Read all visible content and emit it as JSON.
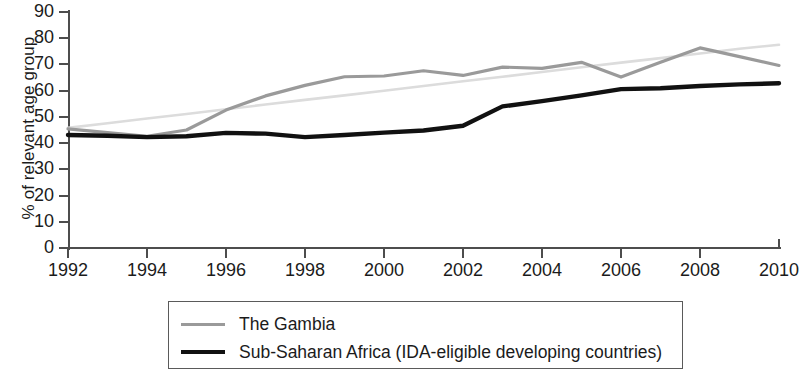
{
  "chart_data": {
    "type": "line",
    "title": "",
    "subtitle": "",
    "xlabel": "",
    "ylabel": "% of relevant age group",
    "xlim": [
      1992,
      2010
    ],
    "ylim": [
      0,
      90
    ],
    "ytick_step": 10,
    "xtick_step": 2,
    "grid": false,
    "legend_position": "below-center",
    "xticks": [
      "1992",
      "1994",
      "1996",
      "1998",
      "2000",
      "2002",
      "2004",
      "2006",
      "2008",
      "2010"
    ],
    "yticks": [
      "0",
      "10",
      "20",
      "30",
      "40",
      "50",
      "60",
      "70",
      "80",
      "90"
    ],
    "x": [
      1992,
      1993,
      1994,
      1995,
      1996,
      1997,
      1998,
      1999,
      2000,
      2001,
      2002,
      2003,
      2004,
      2005,
      2006,
      2007,
      2008,
      2009,
      2010
    ],
    "series": [
      {
        "name": "The Gambia",
        "color": "#9a9a9a",
        "width": 3.2,
        "values": [
          45.4,
          44.0,
          42.6,
          45.0,
          52.6,
          58.0,
          62.0,
          65.3,
          65.6,
          67.6,
          65.8,
          69.0,
          68.5,
          70.8,
          65.2,
          70.8,
          76.3,
          73.0,
          69.6
        ]
      },
      {
        "name": "Sub-Saharan Africa (IDA-eligible developing countries)",
        "color": "#111111",
        "width": 4.4,
        "values": [
          43.1,
          42.8,
          42.3,
          42.6,
          43.9,
          43.6,
          42.3,
          43.1,
          44.0,
          44.8,
          46.6,
          54.0,
          56.0,
          58.2,
          60.6,
          60.9,
          61.8,
          62.4,
          62.8
        ]
      },
      {
        "name": "trend",
        "color": "#dcdcdc",
        "width": 2.6,
        "is_trendline": true,
        "values": [
          45.8,
          47.6,
          49.4,
          51.1,
          52.9,
          54.7,
          56.5,
          58.2,
          60.0,
          61.8,
          63.6,
          65.3,
          67.1,
          68.9,
          70.7,
          72.4,
          74.2,
          76.0,
          77.5
        ]
      }
    ]
  },
  "legend": {
    "items": [
      {
        "label": "The Gambia",
        "swatch": "gray-line-swatch"
      },
      {
        "label": "Sub-Saharan Africa (IDA-eligible developing countries)",
        "swatch": "black-line-swatch"
      }
    ]
  }
}
